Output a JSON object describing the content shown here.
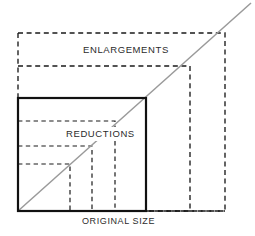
{
  "diagram": {
    "labels": {
      "enlargements": "ENLARGEMENTS",
      "reductions": "REDUCTIONS",
      "original_size": "ORIGINAL  SIZE"
    },
    "colors": {
      "background": "#ffffff",
      "solid_outline": "#111111",
      "dashed_outline": "#1a1a1a",
      "diagonal": "#9a9a9a",
      "text": "#2b2b2b"
    },
    "origin": {
      "x": 18,
      "y": 211
    },
    "original_box": {
      "name": "original-size-box",
      "style": "solid",
      "left": 18,
      "top": 98,
      "right": 146,
      "bottom": 211,
      "width": 128,
      "height": 113
    },
    "diagonal": {
      "name": "proportion-diagonal",
      "x1": 18,
      "y1": 211,
      "x2": 251,
      "y2": 3
    },
    "enlargement_boxes": [
      {
        "name": "enlargement-box-small",
        "style": "dashed",
        "left": 18,
        "top": 66,
        "right": 190,
        "bottom": 211,
        "width": 172,
        "height": 145
      },
      {
        "name": "enlargement-box-large",
        "style": "dashed",
        "left": 18,
        "top": 33,
        "right": 225,
        "bottom": 211,
        "width": 207,
        "height": 178
      }
    ],
    "reduction_boxes": [
      {
        "name": "reduction-box-large",
        "style": "dashed",
        "left": 18,
        "top": 121,
        "right": 115,
        "bottom": 211,
        "width": 97,
        "height": 90
      },
      {
        "name": "reduction-box-medium",
        "style": "dashed",
        "left": 18,
        "top": 146,
        "right": 92,
        "bottom": 211,
        "width": 74,
        "height": 65
      },
      {
        "name": "reduction-box-small",
        "style": "dashed",
        "left": 18,
        "top": 164,
        "right": 70,
        "bottom": 211,
        "width": 52,
        "height": 47
      }
    ],
    "label_positions": {
      "enlargements": {
        "x": 83,
        "y": 53
      },
      "reductions": {
        "x": 66,
        "y": 137
      },
      "original_size": {
        "x": 82,
        "y": 224
      }
    }
  }
}
